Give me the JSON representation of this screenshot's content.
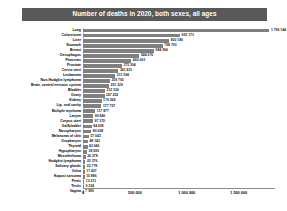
{
  "header": {
    "title": "Number of deaths in 2020, both sexes, all ages",
    "banner_color": "#595959",
    "title_color": "#ffffff"
  },
  "chart_data": {
    "type": "bar",
    "orientation": "horizontal",
    "title": "Number of deaths in 2020, both sexes, all ages",
    "xlabel": "",
    "ylabel": "",
    "xlim": [
      0,
      1850000
    ],
    "grid": false,
    "legend": "none",
    "bar_color": "#808080",
    "axis_ticks": [
      "0",
      "500 000",
      "1 000 000",
      "1 500 000"
    ],
    "axis_tick_values": [
      0,
      500000,
      1000000,
      1500000
    ],
    "categories": [
      "Lung",
      "Colorectum",
      "Liver",
      "Stomach",
      "Breast",
      "Oesophagus",
      "Pancreas",
      "Prostate",
      "Cervix uteri",
      "Leukaemia",
      "Non-Hodgkin lymphoma",
      "Brain, central nervous system",
      "Bladder",
      "Ovary",
      "Kidney",
      "Lip, oral cavity",
      "Multiple myeloma",
      "Larynx",
      "Corpus uteri",
      "Gallbladder",
      "Nasopharynx",
      "Melanoma of skin",
      "Oropharynx",
      "Thyroid",
      "Hypopharynx",
      "Mesothelioma",
      "Hodgkin lymphoma",
      "Salivary glands",
      "Vulva",
      "Kaposi sarcoma",
      "Penis",
      "Testis",
      "Vagina"
    ],
    "values": [
      1796144,
      935173,
      830180,
      768793,
      684996,
      544076,
      466003,
      375304,
      341831,
      311594,
      259793,
      251329,
      212536,
      207252,
      179368,
      177757,
      117877,
      99840,
      97370,
      84695,
      80008,
      57043,
      48143,
      43646,
      38599,
      26278,
      23376,
      22778,
      17427,
      15886,
      13211,
      9334,
      7995
    ],
    "value_labels": [
      "1 796 144",
      "935 173",
      "830 180",
      "768 793",
      "684 996",
      "544 076",
      "466 003",
      "375 304",
      "341 831",
      "311 594",
      "259 793",
      "251 329",
      "212 536",
      "207 252",
      "179 368",
      "177 757",
      "117 877",
      "99 840",
      "97 370",
      "84 695",
      "80 008",
      "57 043",
      "48 143",
      "43 646",
      "38 599",
      "26 278",
      "23 376",
      "22 778",
      "17 427",
      "15 886",
      "13 211",
      "9 334",
      "7 995"
    ]
  }
}
